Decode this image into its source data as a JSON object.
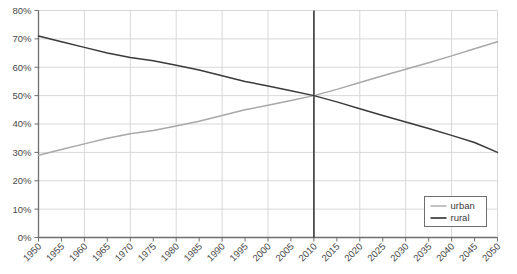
{
  "chart_data": {
    "type": "line",
    "title": "",
    "xlabel": "",
    "ylabel": "",
    "xlim": [
      1950,
      2050
    ],
    "ylim": [
      0,
      80
    ],
    "grid": true,
    "legend_position": "bottom-right",
    "y_ticks": [
      0,
      10,
      20,
      30,
      40,
      50,
      60,
      70,
      80
    ],
    "y_tick_labels": [
      "0%",
      "10%",
      "20%",
      "30%",
      "40%",
      "50%",
      "60%",
      "70%",
      "80%"
    ],
    "x": [
      1950,
      1955,
      1960,
      1965,
      1970,
      1975,
      1980,
      1985,
      1990,
      1995,
      2000,
      2005,
      2010,
      2015,
      2020,
      2025,
      2030,
      2035,
      2040,
      2045,
      2050
    ],
    "x_tick_labels": [
      "1950",
      "1955",
      "1960",
      "1965",
      "1970",
      "1975",
      "1980",
      "1985",
      "1990",
      "1995",
      "2000",
      "2005",
      "2010",
      "2015",
      "2020",
      "2025",
      "2030",
      "2035",
      "2040",
      "2045",
      "2050"
    ],
    "series": [
      {
        "name": "urban",
        "color": "#a8a8a8",
        "values": [
          29,
          31,
          33,
          35,
          36.6,
          37.7,
          39.3,
          41,
          43,
          45,
          46.6,
          48.3,
          50,
          52.2,
          54.6,
          57,
          59.3,
          61.6,
          64,
          66.5,
          69
        ]
      },
      {
        "name": "rural",
        "color": "#3a3a3a",
        "values": [
          71,
          69,
          67,
          65,
          63.4,
          62.3,
          60.7,
          59,
          57,
          55,
          53.4,
          51.7,
          50,
          47.8,
          45.4,
          43,
          40.7,
          38.4,
          36,
          33.5,
          30
        ]
      }
    ],
    "annotations": [
      {
        "type": "vertical-line",
        "x": 2010,
        "color": "#3a3a3a",
        "label": ""
      }
    ]
  },
  "legend": {
    "items": [
      {
        "label": "urban",
        "color": "#a8a8a8"
      },
      {
        "label": "rural",
        "color": "#3a3a3a"
      }
    ]
  },
  "colors": {
    "urban": "#a8a8a8",
    "rural": "#3a3a3a",
    "grid": "#d8d8d8",
    "axis": "#6e6e6e",
    "background": "#ffffff",
    "marker_line": "#3a3a3a"
  }
}
